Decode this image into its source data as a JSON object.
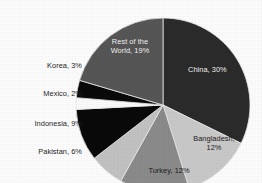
{
  "chart_data": {
    "type": "pie",
    "title": "",
    "subtitle": "",
    "xlabel": "",
    "ylabel": "",
    "legend_position": "none",
    "grid": false,
    "start_angle_deg": 0,
    "direction": "clockwise",
    "categories": [
      "China",
      "Bangladesh",
      "Turkey",
      "Pakistan",
      "Indonesia",
      "Mexico",
      "Korea",
      "Rest of the World"
    ],
    "values": [
      30,
      12,
      12,
      6,
      9,
      2,
      3,
      19
    ],
    "value_unit": "%",
    "slices": [
      {
        "name": "China",
        "value": 30,
        "label": "China, 30%",
        "color": "#2b2b2b",
        "label_placement": "inside",
        "label_on_dark": true
      },
      {
        "name": "Bangladesh",
        "value": 12,
        "label": "Bangladesh,\n12%",
        "color": "#c9c9c9",
        "label_placement": "inside",
        "label_on_dark": false
      },
      {
        "name": "Turkey",
        "value": 12,
        "label": "Turkey, 12%",
        "color": "#8b8b8b",
        "label_placement": "inside",
        "label_on_dark": false
      },
      {
        "name": "Pakistan",
        "value": 6,
        "label": "Pakistan, 6%",
        "color": "#c2c2c2",
        "label_placement": "outside",
        "label_on_dark": false
      },
      {
        "name": "Indonesia",
        "value": 9,
        "label": "Indonesia, 9%",
        "color": "#0a0a0a",
        "label_placement": "outside",
        "label_on_dark": false
      },
      {
        "name": "Mexico",
        "value": 2,
        "label": "Mexico, 2%",
        "color": "#fbfbfb",
        "label_placement": "outside",
        "label_on_dark": false
      },
      {
        "name": "Korea",
        "value": 3,
        "label": "Korea, 3%",
        "color": "#0a0a0a",
        "label_placement": "outside",
        "label_on_dark": false
      },
      {
        "name": "Rest of the World",
        "value": 19,
        "label": "Rest of the\nWorld, 19%",
        "color": "#565656",
        "label_placement": "inside",
        "label_on_dark": true
      }
    ]
  },
  "figure": {
    "background": "#fdfdfd",
    "separator_color": "#e8e8e8",
    "center_x": 163,
    "center_y": 105,
    "radius": 87
  }
}
